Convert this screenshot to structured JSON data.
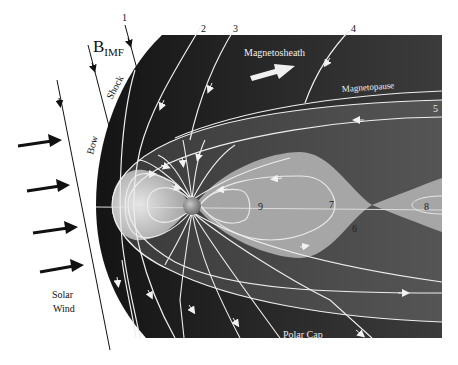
{
  "figure": {
    "colors": {
      "background": "#ffffff",
      "magnetosheath": "#1e1e1e",
      "magnetosphere": "#3a3a3a",
      "lobe_light": "#a8a8a8",
      "plasmasphere": "#c4c4c4",
      "field_line": "#eeeeee",
      "ink": "#111111"
    },
    "labels": {
      "b_imf": "B",
      "b_imf_sub": "IMF",
      "bow": "Bow",
      "shock": "Shock",
      "magnetosheath": "Magnetosheath",
      "magnetopause": "Magnetopause",
      "solar_wind_line1": "Solar",
      "solar_wind_line2": "Wind",
      "polar_cap": "Polar Cap"
    },
    "field_line_numbers": [
      "1",
      "2",
      "3",
      "4",
      "5",
      "6",
      "7",
      "8",
      "9"
    ],
    "solar_wind_arrows": 4,
    "bleed_through_text": {
      "top": "...ometry of the magnetosphere and the Earth's...",
      "bottom": "...the magnetosphere interaction with the..."
    }
  }
}
